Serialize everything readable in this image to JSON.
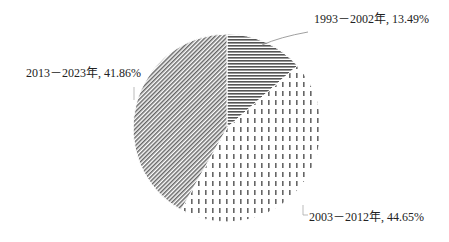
{
  "chart_data": {
    "type": "pie",
    "title": "",
    "categories": [
      "1993－2002年",
      "2003－2012年",
      "2013－2023年"
    ],
    "values": [
      13.49,
      44.65,
      41.86
    ],
    "unit": "%",
    "labels": [
      "1993－2002年, 13.49%",
      "2003－2012年, 44.65%",
      "2013－2023年, 41.86%"
    ],
    "patterns": [
      "horizontal-lines",
      "vertical-dashes",
      "diagonal-lines"
    ],
    "start_angle_deg": 0,
    "direction": "clockwise",
    "legend": "none",
    "grid": false
  },
  "labels": {
    "slice1": "1993－2002年, 13.49%",
    "slice2": "2003－2012年, 44.65%",
    "slice3": "2013－2023年, 41.86%"
  },
  "colors": {
    "pattern_stroke": "#555555",
    "leader_line": "#888888",
    "text": "#222222"
  }
}
